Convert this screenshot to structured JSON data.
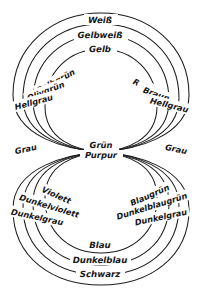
{
  "figure": {
    "language": "de",
    "background_color": "#ffffff",
    "line_color": "#1c1c1c",
    "text_color": "#161616",
    "width": 203,
    "height": 298
  },
  "center": {
    "labels": [
      {
        "id": "center-gruen",
        "text": "Grün",
        "x": 101,
        "y": 148
      },
      {
        "id": "center-purpur",
        "text": "Purpur",
        "x": 101,
        "y": 157
      }
    ]
  },
  "side_labels": [
    {
      "id": "side-grau-left",
      "text": "Grau",
      "x": 26,
      "y": 152,
      "anchor": "middle",
      "rotate": -12
    },
    {
      "id": "side-grau-right",
      "text": "Grau",
      "x": 176,
      "y": 152,
      "anchor": "middle",
      "rotate": 12
    }
  ],
  "upper_loop": {
    "name": "obere Schleife",
    "top_labels": [
      {
        "id": "top-weiss",
        "text": "Weiß",
        "x": 100,
        "y": 21,
        "rotate": 0
      },
      {
        "id": "top-gelbweiss",
        "text": "Gelbweiß",
        "x": 100,
        "y": 36,
        "rotate": 0
      },
      {
        "id": "top-gelb",
        "text": "Gelb",
        "x": 100,
        "y": 50,
        "rotate": 0
      }
    ],
    "left_labels": [
      {
        "id": "ul-gelbgruen",
        "text": "Gelbgrün",
        "x": 54,
        "y": 82,
        "rotate": -28
      },
      {
        "id": "ul-olivgruen",
        "text": "Olivgrün",
        "x": 45,
        "y": 92,
        "rotate": -22
      },
      {
        "id": "ul-hellgrau",
        "text": "Hellgrau",
        "x": 33,
        "y": 103,
        "rotate": -16
      }
    ],
    "right_labels": [
      {
        "id": "ur-rot",
        "text": "Rot",
        "x": 140,
        "y": 85,
        "rotate": 26
      },
      {
        "id": "ur-braun",
        "text": "Braun",
        "x": 156,
        "y": 95,
        "rotate": 20
      },
      {
        "id": "ur-hellgrau",
        "text": "Hellgrau",
        "x": 170,
        "y": 106,
        "rotate": 15
      }
    ]
  },
  "lower_loop": {
    "name": "untere Schleife",
    "bottom_labels": [
      {
        "id": "bt-blau",
        "text": "Blau",
        "x": 100,
        "y": 246,
        "rotate": 0
      },
      {
        "id": "bt-dunkelblau",
        "text": "Dunkelblau",
        "x": 100,
        "y": 261,
        "rotate": 0
      },
      {
        "id": "bt-schwarz",
        "text": "Schwarz",
        "x": 100,
        "y": 275,
        "rotate": 0
      }
    ],
    "left_labels": [
      {
        "id": "ll-violett",
        "text": "Violett",
        "x": 56,
        "y": 196,
        "rotate": 24
      },
      {
        "id": "ll-dunkelviolett",
        "text": "Dunkelviolett",
        "x": 48,
        "y": 207,
        "rotate": 18
      },
      {
        "id": "ll-dunkelgrau",
        "text": "Dunkelgrau",
        "x": 36,
        "y": 218,
        "rotate": 13
      }
    ],
    "right_labels": [
      {
        "id": "lr-blaugruen",
        "text": "Blaugrün",
        "x": 152,
        "y": 196,
        "rotate": -24
      },
      {
        "id": "lr-dunkelblaugruen",
        "text": "Dunkelblaugrün",
        "x": 152,
        "y": 207,
        "rotate": -18
      },
      {
        "id": "lr-dunkelgrau",
        "text": "Dunkelgrau",
        "x": 160,
        "y": 218,
        "rotate": -13
      }
    ]
  },
  "geometry": {
    "center_x": 101,
    "center_y": 152,
    "upper_rings": [
      {
        "id": "upper-ring-1",
        "rx": 88,
        "ry": 70
      },
      {
        "id": "upper-ring-2",
        "rx": 78,
        "ry": 62
      },
      {
        "id": "upper-ring-3",
        "rx": 68,
        "ry": 55
      },
      {
        "id": "upper-ring-4",
        "rx": 57,
        "ry": 47
      }
    ],
    "lower_rings": [
      {
        "id": "lower-ring-1",
        "rx": 88,
        "ry": 70
      },
      {
        "id": "lower-ring-2",
        "rx": 78,
        "ry": 62
      },
      {
        "id": "lower-ring-3",
        "rx": 68,
        "ry": 55
      },
      {
        "id": "lower-ring-4",
        "rx": 57,
        "ry": 47
      }
    ]
  }
}
